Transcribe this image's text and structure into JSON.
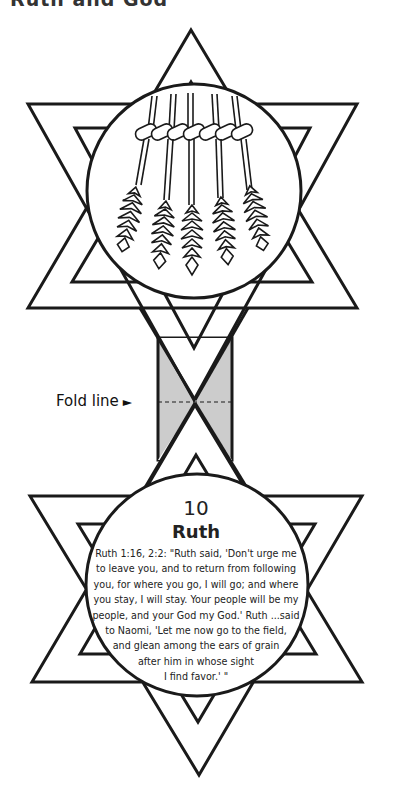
{
  "header": {
    "title": "Ruth and God"
  },
  "fold": {
    "label": "Fold line",
    "arrow": "►"
  },
  "card": {
    "number": "10",
    "title": "Ruth",
    "verse_lines": [
      "Ruth 1:16, 2:2: \"Ruth said, 'Don't urge me",
      "to leave you, and to return from following",
      "you, for where you go, I will go; and where",
      "you stay, I will stay. Your people will be my",
      "people, and your God my God.' Ruth ...said",
      "to Naomi, 'Let me now go to the field,",
      "and glean among the ears of grain",
      "after him in whose sight",
      "I find favor.' \""
    ]
  },
  "illustration": {
    "icon": "wheat-sheaf-icon",
    "shape": "star-of-david"
  },
  "colors": {
    "line": "#1a1a1a",
    "fold_fill": "#cccccc",
    "background": "#ffffff"
  }
}
